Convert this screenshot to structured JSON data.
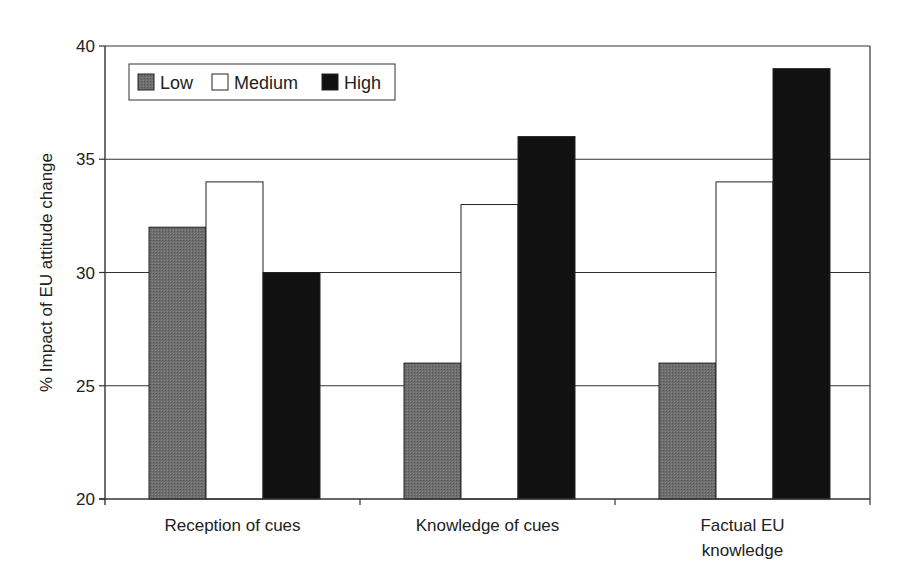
{
  "chart_data": {
    "type": "bar",
    "title": "",
    "xlabel": "",
    "ylabel": "% Impact of EU attitude change",
    "ylim": [
      20,
      40
    ],
    "yticks": [
      20,
      25,
      30,
      35,
      40
    ],
    "grid": true,
    "legend_position": "top-left inside",
    "categories": [
      "Reception of cues",
      "Knowledge of cues",
      "Factual EU knowledge"
    ],
    "category_lines": [
      [
        "Reception of cues"
      ],
      [
        "Knowledge of cues"
      ],
      [
        "Factual EU",
        "knowledge"
      ]
    ],
    "series": [
      {
        "name": "Low",
        "values": [
          32,
          26,
          26
        ],
        "color": "#6b6b6b"
      },
      {
        "name": "Medium",
        "values": [
          34,
          33,
          34
        ],
        "color": "#ffffff"
      },
      {
        "name": "High",
        "values": [
          30,
          36,
          39
        ],
        "color": "#111111"
      }
    ]
  }
}
